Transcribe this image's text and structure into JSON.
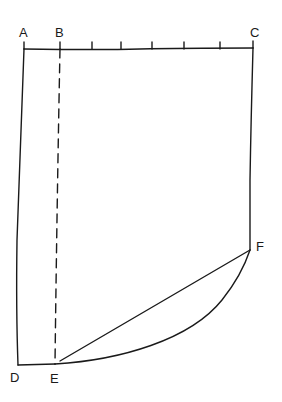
{
  "diagram": {
    "type": "pattern-draft",
    "background": "#ffffff",
    "ink_color": "#1a1a1a",
    "points": {
      "A": {
        "label": "A",
        "x": 24,
        "y": 49
      },
      "B": {
        "label": "B",
        "x": 60,
        "y": 49
      },
      "C": {
        "label": "C",
        "x": 253,
        "y": 48
      },
      "D": {
        "label": "D",
        "x": 18,
        "y": 365
      },
      "E": {
        "label": "E",
        "x": 55,
        "y": 364
      },
      "F": {
        "label": "F",
        "x": 250,
        "y": 250
      }
    },
    "top_edge_ticks_x": [
      24,
      60,
      92,
      121,
      152,
      184,
      220,
      253
    ],
    "edges": [
      {
        "from": "A",
        "to": "C",
        "style": "solid",
        "name": "top-edge"
      },
      {
        "from": "A",
        "to": "D",
        "style": "solid",
        "name": "left-edge"
      },
      {
        "from": "C",
        "to": "F",
        "style": "solid",
        "name": "right-edge"
      },
      {
        "from": "D",
        "to": "E",
        "style": "solid",
        "name": "bottom-edge"
      },
      {
        "from": "B",
        "to": "E",
        "style": "dashed",
        "name": "dashed-guide-line"
      },
      {
        "from": "E",
        "to": "F",
        "style": "solid-straight",
        "name": "straight-line-e-f"
      },
      {
        "from": "E",
        "to": "F",
        "style": "solid-curve",
        "name": "curved-hem-e-f"
      }
    ]
  }
}
